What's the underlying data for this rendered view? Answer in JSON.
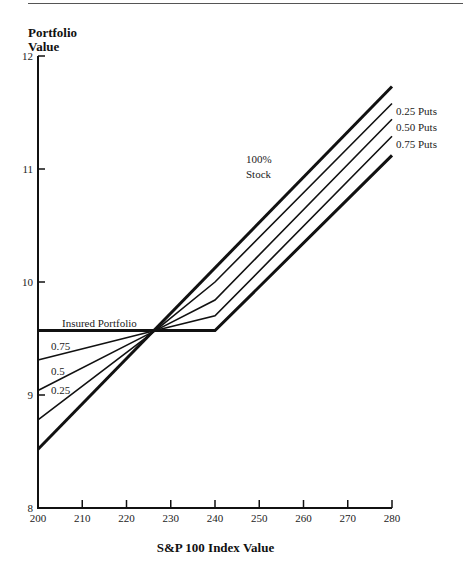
{
  "chart_data": {
    "type": "line",
    "title": "",
    "xlabel": "S&P 100 Index Value",
    "ylabel": "Portfolio Value",
    "xlim": [
      200,
      280
    ],
    "ylim": [
      8,
      12
    ],
    "x_ticks": [
      200,
      210,
      220,
      230,
      240,
      250,
      260,
      270,
      280
    ],
    "y_ticks": [
      8,
      9,
      10,
      11,
      12
    ],
    "grid": false,
    "legend": "inline labels",
    "series": [
      {
        "name": "100% Stock",
        "label_right": "",
        "label_left": "",
        "weight": "bold",
        "points": [
          [
            200,
            8.52
          ],
          [
            280,
            11.73
          ]
        ]
      },
      {
        "name": "0.25 Puts",
        "label_right": "0.25 Puts",
        "label_left": "0.25",
        "weight": "normal",
        "points": [
          [
            200,
            8.78
          ],
          [
            226.5,
            9.57
          ],
          [
            240,
            10.0
          ],
          [
            280,
            11.58
          ]
        ]
      },
      {
        "name": "0.50 Puts",
        "label_right": "0.50 Puts",
        "label_left": "0.5",
        "weight": "normal",
        "points": [
          [
            200,
            9.04
          ],
          [
            226.5,
            9.57
          ],
          [
            240,
            9.84
          ],
          [
            280,
            11.44
          ]
        ]
      },
      {
        "name": "0.75 Puts",
        "label_right": "0.75 Puts",
        "label_left": "0.75",
        "weight": "normal",
        "points": [
          [
            200,
            9.31
          ],
          [
            226.5,
            9.57
          ],
          [
            240,
            9.7
          ],
          [
            280,
            11.29
          ]
        ]
      },
      {
        "name": "Insured Portfolio",
        "label_right": "",
        "label_left": "Insured Portfolio",
        "weight": "bold",
        "points": [
          [
            200,
            9.57
          ],
          [
            240,
            9.57
          ],
          [
            280,
            11.12
          ]
        ]
      }
    ],
    "annotations": [
      {
        "text": "100%",
        "x": 247,
        "y": 11.05
      },
      {
        "text": "Stock",
        "x": 247,
        "y": 10.92
      }
    ]
  },
  "labels": {
    "y_axis_line1": "Portfolio",
    "y_axis_line2": "Value",
    "x_axis": "S&P 100 Index Value"
  }
}
